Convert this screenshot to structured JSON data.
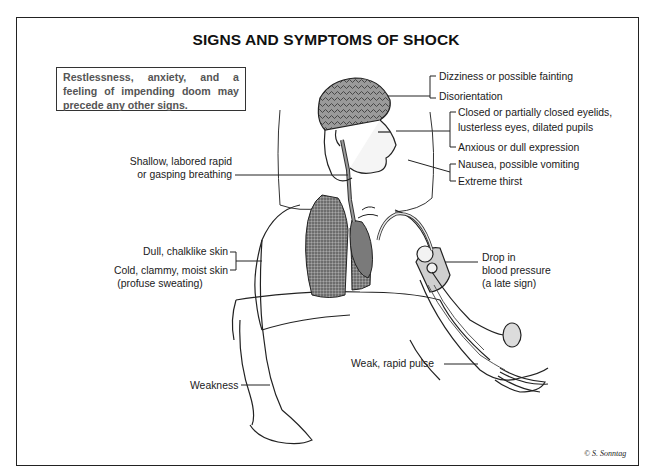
{
  "diagram": {
    "title": "SIGNS AND SYMPTOMS OF SHOCK",
    "callout_box": "Restlessness, anxiety, and a feeling of impending doom may precede any other signs.",
    "labels": {
      "head_group": {
        "dizziness": "Dizziness or possible fainting",
        "disorientation": "Disorientation"
      },
      "eyes_group": {
        "eyelids_line1": "Closed or partially closed eyelids,",
        "eyelids_line2": "lusterless eyes, dilated pupils",
        "expression": "Anxious or dull expression"
      },
      "mouth_group": {
        "nausea": "Nausea, possible vomiting",
        "thirst": "Extreme thirst"
      },
      "breathing": {
        "line1": "Shallow, labored rapid",
        "line2": "or gasping breathing"
      },
      "skin_group": {
        "dull_skin": "Dull, chalklike skin",
        "clammy_line1": "Cold, clammy, moist skin",
        "clammy_line2": "(profuse sweating)"
      },
      "blood_pressure": {
        "line1": "Drop in",
        "line2": "blood pressure",
        "line3": "(a late sign)"
      },
      "pulse": "Weak, rapid pulse",
      "weakness": "Weakness"
    },
    "signature": "© S. Sonntag",
    "illustration_elements": [
      "pillow",
      "head-with-brain",
      "airway",
      "lungs",
      "heart",
      "blood-pressure-cuff",
      "bulb-pump",
      "arms",
      "sheet"
    ]
  }
}
